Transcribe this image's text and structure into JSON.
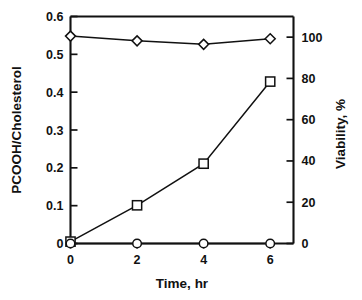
{
  "chart_data": {
    "type": "line",
    "title": "",
    "xlabel": "Time, hr",
    "ylabel": "PCOOH/Cholesterol",
    "y2label": "Viability, %",
    "x": [
      0,
      2,
      4,
      6
    ],
    "xlim": [
      0,
      6.7
    ],
    "ylim": [
      0,
      0.6
    ],
    "y2lim": [
      0,
      110
    ],
    "xticks": [
      0,
      2,
      4,
      6
    ],
    "xtick_labels": [
      "0",
      "2",
      "4",
      "6"
    ],
    "yticks": [
      0,
      0.1,
      0.2,
      0.3,
      0.4,
      0.5,
      0.6
    ],
    "ytick_labels": [
      "0",
      "0.1",
      "0.2",
      "0.3",
      "0.4",
      "0.5",
      "0.6"
    ],
    "y2ticks": [
      0,
      20,
      40,
      60,
      80,
      100
    ],
    "y2tick_labels": [
      "0",
      "20",
      "40",
      "60",
      "80",
      "100"
    ],
    "grid": false,
    "legend": "none",
    "series": [
      {
        "name": "PCOOH/Cholesterol",
        "axis": "left",
        "marker": "open-square",
        "values": [
          0.005,
          0.101,
          0.211,
          0.428
        ]
      },
      {
        "name": "Viability, %",
        "axis": "right",
        "marker": "open-diamond",
        "values": [
          100.5,
          98.2,
          96.5,
          99.2
        ]
      },
      {
        "name": "Baseline",
        "axis": "right",
        "marker": "open-circle",
        "values": [
          0,
          0,
          0,
          0
        ]
      }
    ]
  }
}
